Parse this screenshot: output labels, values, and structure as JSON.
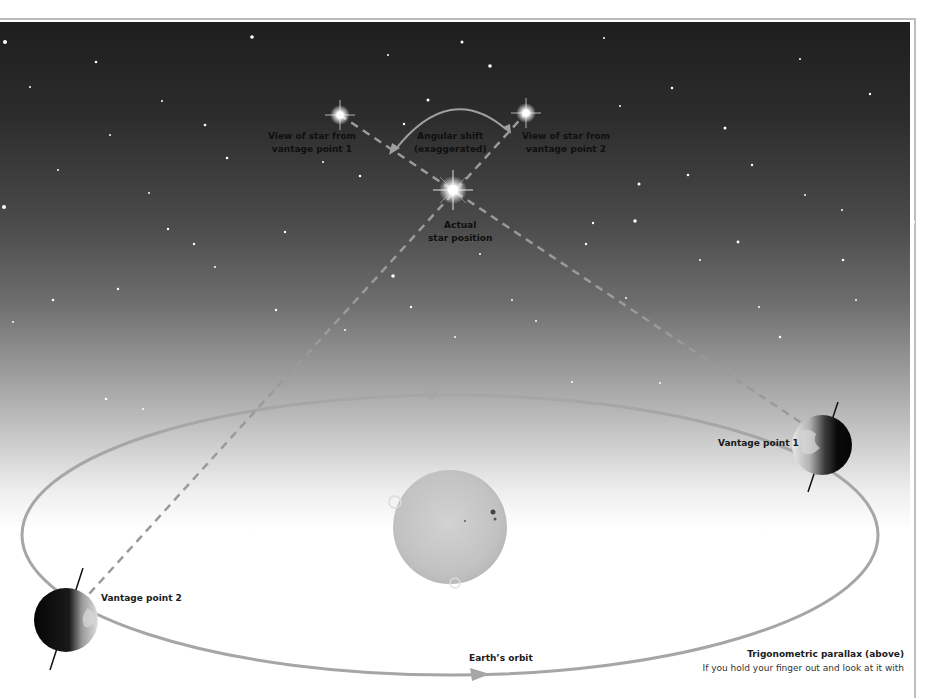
{
  "diagram": {
    "title": "Trigonometric parallax",
    "labels": {
      "view_star_vp1": [
        "View of star from",
        "vantage point 1"
      ],
      "angular_shift": [
        "Angular shift",
        "(exaggerated)"
      ],
      "view_star_vp2": [
        "View of star from",
        "vantage point 2"
      ],
      "actual_star": [
        "Actual",
        "star position"
      ],
      "vantage_point_1": "Vantage point 1",
      "vantage_point_2": "Vantage point 2",
      "earths_orbit": "Earth’s orbit"
    },
    "caption": {
      "title": "Trigonometric parallax (above)",
      "text": "If you hold your finger out and look at it with"
    },
    "elements": {
      "sun": {
        "cx": 450,
        "cy": 527,
        "r": 57
      },
      "orbit": {
        "cx": 450,
        "cy": 535,
        "rx": 428,
        "ry": 140
      },
      "earth_vp1": {
        "cx": 822,
        "cy": 445,
        "r": 30
      },
      "earth_vp2": {
        "cx": 66,
        "cy": 620,
        "r": 32
      },
      "star_apparent_1": {
        "cx": 340,
        "cy": 115
      },
      "star_apparent_2": {
        "cx": 526,
        "cy": 113
      },
      "star_actual": {
        "cx": 453,
        "cy": 190
      }
    },
    "colors": {
      "sky_top": "#1e1e1e",
      "sky_bottom": "#ffffff",
      "orbit": "#a6a6a6",
      "dashed_line": "#9a9a9a",
      "sun": "#c4c4c4",
      "earth_dark": "#0a0a0a",
      "frame": "#bdbdbd"
    }
  }
}
